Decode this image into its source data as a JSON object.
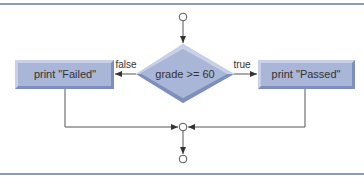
{
  "diagram": {
    "type": "activity-diagram",
    "decision": {
      "label": "grade >= 60"
    },
    "actions": {
      "false_action": {
        "label": "print \"Failed\""
      },
      "true_action": {
        "label": "print \"Passed\""
      }
    },
    "guards": {
      "false": "false",
      "true": "true"
    },
    "nodes": [
      "initial-state",
      "decision",
      "action-failed",
      "action-passed",
      "merge",
      "final-state"
    ],
    "colors": {
      "fill": "#a9b6d8",
      "fill_light": "#c8d1e8",
      "fill_dark": "#7f8fbd",
      "line": "#555555",
      "rule": "#8e9bb0"
    }
  }
}
